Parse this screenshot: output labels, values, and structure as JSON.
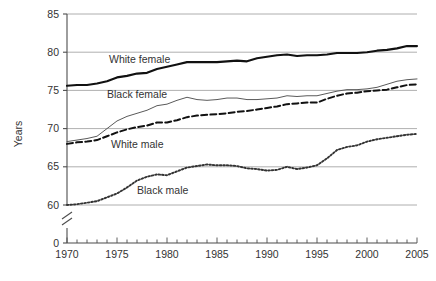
{
  "chart_data": {
    "type": "line",
    "title": "",
    "xlabel": "",
    "ylabel": "Years",
    "xlim": [
      1970,
      2005
    ],
    "ylim": [
      60,
      85
    ],
    "y_axis_break": true,
    "y_break_labels": [
      "0"
    ],
    "grid": "horizontal",
    "legend_position": "inline-annotations",
    "y_ticks": [
      "85",
      "80",
      "75",
      "70",
      "65",
      "60",
      "0"
    ],
    "y_tick_values": [
      85,
      80,
      75,
      70,
      65,
      60,
      0
    ],
    "x_ticks": [
      "1970",
      "1975",
      "1980",
      "1985",
      "1990",
      "1995",
      "2000",
      "2005"
    ],
    "x_tick_values": [
      1970,
      1975,
      1980,
      1985,
      1990,
      1995,
      2000,
      2005
    ],
    "x_minor_tick_step": 1,
    "x": [
      1970,
      1971,
      1972,
      1973,
      1974,
      1975,
      1976,
      1977,
      1978,
      1979,
      1980,
      1981,
      1982,
      1983,
      1984,
      1985,
      1986,
      1987,
      1988,
      1989,
      1990,
      1991,
      1992,
      1993,
      1994,
      1995,
      1996,
      1997,
      1998,
      1999,
      2000,
      2001,
      2002,
      2003,
      2004,
      2005
    ],
    "series": [
      {
        "name": "White female",
        "style": "solid-thick",
        "color": "#111111",
        "label_x": 1974.2,
        "label_y": 79.0,
        "values": [
          75.6,
          75.7,
          75.7,
          75.9,
          76.2,
          76.7,
          76.9,
          77.2,
          77.3,
          77.8,
          78.1,
          78.4,
          78.7,
          78.7,
          78.7,
          78.7,
          78.8,
          78.9,
          78.8,
          79.2,
          79.4,
          79.6,
          79.7,
          79.5,
          79.6,
          79.6,
          79.7,
          79.9,
          79.9,
          79.9,
          80.0,
          80.2,
          80.3,
          80.5,
          80.8,
          80.8
        ]
      },
      {
        "name": "Black female",
        "style": "solid-thin",
        "color": "#5a5a5a",
        "label_x": 1974.0,
        "label_y": 74.5,
        "values": [
          68.3,
          68.5,
          68.7,
          69.0,
          70.0,
          71.0,
          71.6,
          72.0,
          72.4,
          73.0,
          73.2,
          73.7,
          74.1,
          73.8,
          73.7,
          73.8,
          74.0,
          74.0,
          73.8,
          73.8,
          73.9,
          74.0,
          74.3,
          74.2,
          74.3,
          74.3,
          74.6,
          74.9,
          75.1,
          75.1,
          75.2,
          75.4,
          75.8,
          76.2,
          76.4,
          76.5
        ]
      },
      {
        "name": "White male",
        "style": "dashed",
        "color": "#111111",
        "label_x": 1974.4,
        "label_y": 67.9,
        "values": [
          68.0,
          68.2,
          68.3,
          68.5,
          69.0,
          69.5,
          69.9,
          70.2,
          70.4,
          70.8,
          70.8,
          71.1,
          71.5,
          71.7,
          71.8,
          71.9,
          72.0,
          72.2,
          72.3,
          72.5,
          72.7,
          72.9,
          73.2,
          73.3,
          73.4,
          73.4,
          73.9,
          74.3,
          74.6,
          74.7,
          74.9,
          75.0,
          75.1,
          75.4,
          75.7,
          75.8
        ]
      },
      {
        "name": "Black male",
        "style": "dotted",
        "color": "#333333",
        "label_x": 1977.0,
        "label_y": 61.9,
        "values": [
          60.0,
          60.1,
          60.3,
          60.5,
          61.0,
          61.5,
          62.3,
          63.2,
          63.7,
          64.0,
          63.9,
          64.4,
          64.9,
          65.1,
          65.3,
          65.2,
          65.2,
          65.1,
          64.8,
          64.7,
          64.5,
          64.6,
          65.0,
          64.7,
          64.9,
          65.2,
          66.1,
          67.2,
          67.6,
          67.8,
          68.3,
          68.6,
          68.8,
          69.0,
          69.2,
          69.3
        ]
      }
    ]
  }
}
